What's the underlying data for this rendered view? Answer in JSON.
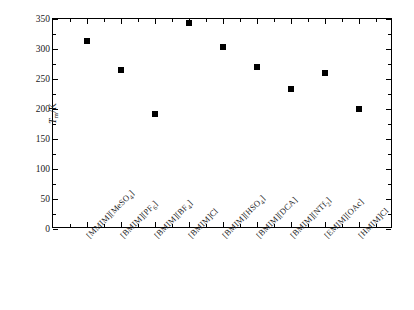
{
  "chart_data": {
    "type": "scatter",
    "title": "",
    "subtitle": "",
    "xlabel": "",
    "ylabel": "Tm/K",
    "ylabel_parts": {
      "italic": "T",
      "subscript": "m",
      "tail": "/K"
    },
    "categories": [
      "[MMIM][MeSO4]",
      "[BMIM][PF6]",
      "[BMIM][BF4]",
      "[BMIM]Cl",
      "[BMIM][HSO4]",
      "[BMIM][DCA]",
      "[BMIM][NTf2]",
      "[EMIM][OAc]",
      "[HMIM]Cl"
    ],
    "category_labels_rich": [
      {
        "pre": "[MMIM][MeSO",
        "sub": "4",
        "post": "]"
      },
      {
        "pre": "[BMIM][PF",
        "sub": "6",
        "post": "]"
      },
      {
        "pre": "[BMIM][BF",
        "sub": "4",
        "post": "]"
      },
      {
        "pre": "[BMIM]Cl",
        "sub": "",
        "post": ""
      },
      {
        "pre": "[BMIM][HSO",
        "sub": "4",
        "post": "]"
      },
      {
        "pre": "[BMIM][DCA]",
        "sub": "",
        "post": ""
      },
      {
        "pre": "[BMIM][NTf",
        "sub": "2",
        "post": "]"
      },
      {
        "pre": "[EMIM][OAc]",
        "sub": "",
        "post": ""
      },
      {
        "pre": "[HMIM]Cl",
        "sub": "",
        "post": ""
      }
    ],
    "values": [
      313,
      265,
      192,
      343,
      303,
      270,
      233,
      260,
      200
    ],
    "ylim": [
      0,
      350
    ],
    "ytick_values": [
      0,
      50,
      100,
      150,
      200,
      250,
      300,
      350
    ],
    "ytick_labels": [
      "0",
      "50",
      "100",
      "150",
      "200",
      "250",
      "300",
      "350"
    ],
    "y_minor_interval": 25,
    "grid": false,
    "legend": null,
    "marker_style": "filled-square",
    "marker_color": "#000000",
    "axis_color": "#000000",
    "background_color": "#ffffff"
  }
}
